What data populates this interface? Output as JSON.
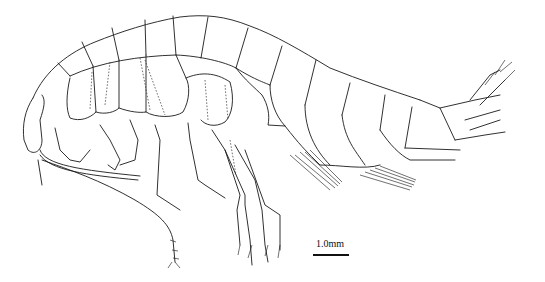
{
  "figure": {
    "scale_bar": {
      "label": "1.0mm",
      "length_px": 36
    },
    "colors": {
      "ink": "#1a1a1a",
      "background": "#ffffff"
    }
  }
}
